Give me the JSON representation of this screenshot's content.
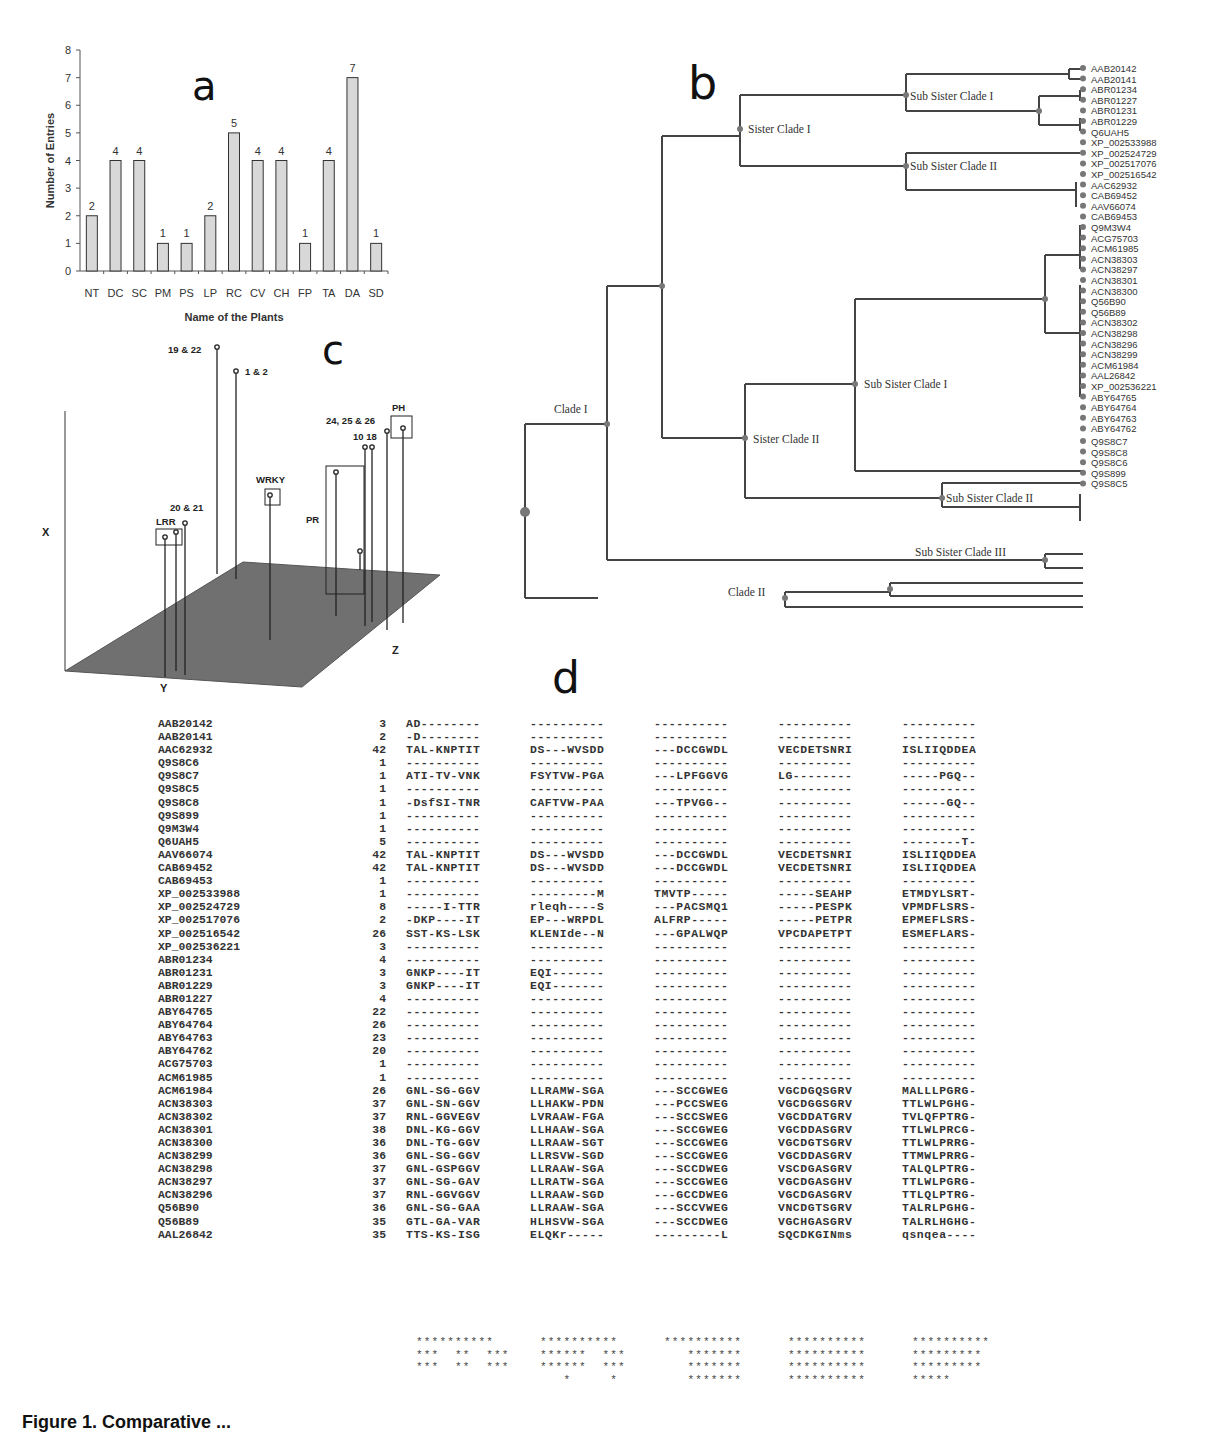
{
  "panels": {
    "a": {
      "label": "a"
    },
    "b": {
      "label": "b"
    },
    "c": {
      "label": "c"
    },
    "d": {
      "label": "d"
    }
  },
  "chart_data": {
    "type": "bar",
    "title": "",
    "xlabel": "Name of the Plants",
    "ylabel": "Number of Entries",
    "categories": [
      "NT",
      "DC",
      "SC",
      "PM",
      "PS",
      "LP",
      "RC",
      "CV",
      "CH",
      "FP",
      "TA",
      "DA",
      "SD"
    ],
    "values": [
      2,
      4,
      4,
      1,
      1,
      2,
      5,
      4,
      4,
      1,
      4,
      7,
      1
    ],
    "data_labels": [
      "2",
      "4",
      "4",
      "1",
      "1",
      "2",
      "5",
      "4",
      "4",
      "1",
      "4",
      "7",
      "1"
    ],
    "yticks": [
      "0",
      "1",
      "2",
      "3",
      "4",
      "5",
      "6",
      "7",
      "8"
    ],
    "ylim": [
      0,
      8
    ],
    "grid": false,
    "bar_color": "#d8d8d8"
  },
  "panel_c": {
    "axes": {
      "x": "X",
      "y": "Y",
      "z": "Z"
    },
    "labels": {
      "p19_22": "19 & 22",
      "p1_2": "1 & 2",
      "p20_21": "20 & 21",
      "lrr": "LRR",
      "wrky": "WRKY",
      "pr": "PR",
      "p24_26": "24, 25 & 26",
      "p10_18": "10 18",
      "ph": "PH"
    },
    "plane_color": "#6e6e6e"
  },
  "tree": {
    "clade_labels": {
      "clade1": "Clade I",
      "clade2": "Clade II",
      "sister1": "Sister Clade I",
      "sister2": "Sister Clade II",
      "sub1a": "Sub Sister Clade I",
      "sub2a": "Sub Sister Clade II",
      "sub1b": "Sub Sister Clade I",
      "sub2b": "Sub Sister Clade II",
      "sub3": "Sub Sister Clade III"
    },
    "leaves": [
      "AAB20142",
      "AAB20141",
      "ABR01234",
      "ABR01227",
      "ABR01231",
      "ABR01229",
      "Q6UAH5",
      "XP_002533988",
      "XP_002524729",
      "XP_002517076",
      "XP_002516542",
      "AAC62932",
      "CAB69452",
      "AAV66074",
      "CAB69453",
      "Q9M3W4",
      "ACG75703",
      "ACM61985",
      "ACN38303",
      "ACN38297",
      "ACN38301",
      "ACN38300",
      "Q56B90",
      "Q56B89",
      "ACN38302",
      "ACN38298",
      "ACN38296",
      "ACN38299",
      "ACM61984",
      "AAL26842",
      "XP_002536221",
      "ABY64765",
      "ABY64764",
      "ABY64763",
      "ABY64762",
      "Q9S8C7",
      "Q9S8C8",
      "Q9S8C6",
      "Q9S899",
      "Q9S8C5"
    ]
  },
  "alignment": {
    "rows": [
      {
        "id": "AAB20142",
        "start": "3",
        "blocks": [
          "AD--------",
          "----------",
          "----------",
          "----------",
          "----------"
        ]
      },
      {
        "id": "AAB20141",
        "start": "2",
        "blocks": [
          "-D--------",
          "----------",
          "----------",
          "----------",
          "----------"
        ]
      },
      {
        "id": "AAC62932",
        "start": "42",
        "blocks": [
          "TAL-KNPTIT",
          "DS---WVSDD",
          "---DCCGWDL",
          "VECDETSNRI",
          "ISLIIQDDEA"
        ]
      },
      {
        "id": "Q9S8C6",
        "start": "1",
        "blocks": [
          "----------",
          "----------",
          "----------",
          "----------",
          "----------"
        ]
      },
      {
        "id": "Q9S8C7",
        "start": "1",
        "blocks": [
          "ATI-TV-VNK",
          "FSYTVW-PGA",
          "---LPFGGVG",
          "LG--------",
          "-----PGQ--"
        ]
      },
      {
        "id": "Q9S8C5",
        "start": "1",
        "blocks": [
          "----------",
          "----------",
          "----------",
          "----------",
          "----------"
        ]
      },
      {
        "id": "Q9S8C8",
        "start": "1",
        "blocks": [
          "-DsfSI-TNR",
          "CAFTVW-PAA",
          "---TPVGG--",
          "----------",
          "------GQ--"
        ]
      },
      {
        "id": "Q9S899",
        "start": "1",
        "blocks": [
          "----------",
          "----------",
          "----------",
          "----------",
          "----------"
        ]
      },
      {
        "id": "Q9M3W4",
        "start": "1",
        "blocks": [
          "----------",
          "----------",
          "----------",
          "----------",
          "----------"
        ]
      },
      {
        "id": "Q6UAH5",
        "start": "5",
        "blocks": [
          "----------",
          "----------",
          "----------",
          "----------",
          "--------T-"
        ]
      },
      {
        "id": "AAV66074",
        "start": "42",
        "blocks": [
          "TAL-KNPTIT",
          "DS---WVSDD",
          "---DCCGWDL",
          "VECDETSNRI",
          "ISLIIQDDEA"
        ]
      },
      {
        "id": "CAB69452",
        "start": "42",
        "blocks": [
          "TAL-KNPTIT",
          "DS---WVSDD",
          "---DCCGWDL",
          "VECDETSNRI",
          "ISLIIQDDEA"
        ]
      },
      {
        "id": "CAB69453",
        "start": "1",
        "blocks": [
          "----------",
          "----------",
          "----------",
          "----------",
          "----------"
        ]
      },
      {
        "id": "XP_002533988",
        "start": "1",
        "blocks": [
          "----------",
          "---------M",
          "TMVTP-----",
          "-----SEAHP",
          "ETMDYLSRT-"
        ]
      },
      {
        "id": "XP_002524729",
        "start": "8",
        "blocks": [
          "-----I-TTR",
          "rleqh----S",
          "---PACSMQ1",
          "-----PESPK",
          "VPMDFLSRS-"
        ]
      },
      {
        "id": "XP_002517076",
        "start": "2",
        "blocks": [
          "-DKP----IT",
          "EP---WRPDL",
          "ALFRP-----",
          "-----PETPR",
          "EPMEFLSRS-"
        ]
      },
      {
        "id": "XP_002516542",
        "start": "26",
        "blocks": [
          "SST-KS-LSK",
          "KLENIde--N",
          "---GPALWQP",
          "VPCDAPETPT",
          "ESMEFLARS-"
        ]
      },
      {
        "id": "XP_002536221",
        "start": "3",
        "blocks": [
          "----------",
          "----------",
          "----------",
          "----------",
          "----------"
        ]
      },
      {
        "id": "ABR01234",
        "start": "4",
        "blocks": [
          "----------",
          "----------",
          "----------",
          "----------",
          "----------"
        ]
      },
      {
        "id": "ABR01231",
        "start": "3",
        "blocks": [
          "GNKP----IT",
          "EQI-------",
          "----------",
          "----------",
          "----------"
        ]
      },
      {
        "id": "ABR01229",
        "start": "3",
        "blocks": [
          "GNKP----IT",
          "EQI-------",
          "----------",
          "----------",
          "----------"
        ]
      },
      {
        "id": "ABR01227",
        "start": "4",
        "blocks": [
          "----------",
          "----------",
          "----------",
          "----------",
          "----------"
        ]
      },
      {
        "id": "ABY64765",
        "start": "22",
        "blocks": [
          "----------",
          "----------",
          "----------",
          "----------",
          "----------"
        ]
      },
      {
        "id": "ABY64764",
        "start": "26",
        "blocks": [
          "----------",
          "----------",
          "----------",
          "----------",
          "----------"
        ]
      },
      {
        "id": "ABY64763",
        "start": "23",
        "blocks": [
          "----------",
          "----------",
          "----------",
          "----------",
          "----------"
        ]
      },
      {
        "id": "ABY64762",
        "start": "20",
        "blocks": [
          "----------",
          "----------",
          "----------",
          "----------",
          "----------"
        ]
      },
      {
        "id": "ACG75703",
        "start": "1",
        "blocks": [
          "----------",
          "----------",
          "----------",
          "----------",
          "----------"
        ]
      },
      {
        "id": "ACM61985",
        "start": "1",
        "blocks": [
          "----------",
          "----------",
          "----------",
          "----------",
          "----------"
        ]
      },
      {
        "id": "ACM61984",
        "start": "26",
        "blocks": [
          "GNL-SG-GGV",
          "LLRAMW-SGA",
          "---SCCGWEG",
          "VGCDGQSGRV",
          "MALLLPGRG-"
        ]
      },
      {
        "id": "ACN38303",
        "start": "37",
        "blocks": [
          "GNL-SN-GGV",
          "LLHAKW-PDN",
          "---PCCSWEG",
          "VGCDGGSGRV",
          "TTLWLPGHG-"
        ]
      },
      {
        "id": "ACN38302",
        "start": "37",
        "blocks": [
          "RNL-GGVEGV",
          "LVRAAW-FGA",
          "---SCCSWEG",
          "VGCDDATGRV",
          "TVLQFPTRG-"
        ]
      },
      {
        "id": "ACN38301",
        "start": "38",
        "blocks": [
          "DNL-KG-GGV",
          "LLHAAW-SGA",
          "---SCCGWEG",
          "VGCDDASGRV",
          "TTLWLPRCG-"
        ]
      },
      {
        "id": "ACN38300",
        "start": "36",
        "blocks": [
          "DNL-TG-GGV",
          "LLRAAW-SGT",
          "---SCCGWEG",
          "VGCDGTSGRV",
          "TTLWLPRRG-"
        ]
      },
      {
        "id": "ACN38299",
        "start": "36",
        "blocks": [
          "GNL-SG-GGV",
          "LLRSVW-SGD",
          "---SCCGWEG",
          "VGCDDASGRV",
          "TTMWLPRRG-"
        ]
      },
      {
        "id": "ACN38298",
        "start": "37",
        "blocks": [
          "GNL-GSPGGV",
          "LLRAAW-SGA",
          "---SCCDWEG",
          "VSCDGASGRV",
          "TALQLPTRG-"
        ]
      },
      {
        "id": "ACN38297",
        "start": "37",
        "blocks": [
          "GNL-SG-GAV",
          "LLRATW-SGA",
          "---SCCGWEG",
          "VGCDGASGHV",
          "TTLWLPGRG-"
        ]
      },
      {
        "id": "ACN38296",
        "start": "37",
        "blocks": [
          "RNL-GGVGGV",
          "LLRAAW-SGD",
          "---GCCDWEG",
          "VGCDGASGRV",
          "TTLQLPTRG-"
        ]
      },
      {
        "id": "Q56B90",
        "start": "36",
        "blocks": [
          "GNL-SG-GAA",
          "LLRAAW-SGA",
          "---SCCVWEG",
          "VNCDGTSGRV",
          "TALRLPGHG-"
        ]
      },
      {
        "id": "Q56B89",
        "start": "35",
        "blocks": [
          "GTL-GA-VAR",
          "HLHSVW-SGA",
          "---SCCDWEG",
          "VGCHGASGRV",
          "TALRLHGHG-"
        ]
      },
      {
        "id": "AAL26842",
        "start": "35",
        "blocks": [
          "TTS-KS-ISG",
          "ELQKr-----",
          "---------L",
          "SQCDKGINms",
          "qsnqea----"
        ]
      }
    ],
    "consensus": [
      [
        "**********",
        "**********",
        "**********",
        "**********",
        "**********"
      ],
      [
        "***  **  ***",
        "******  ***",
        "   *******",
        "**********",
        "*********"
      ],
      [
        "***  **  ***",
        "******  ***",
        "   *******",
        "**********",
        "*********"
      ],
      [
        "",
        "   *     *",
        "   *******",
        "**********",
        "*****"
      ]
    ]
  },
  "caption": "Figure 1. Comparative ..."
}
